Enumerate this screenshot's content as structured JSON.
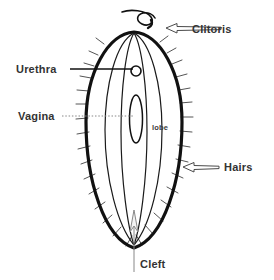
{
  "figure": {
    "background_color": "#ffffff",
    "ink_color": "#111111",
    "label_color": "#333333"
  },
  "labels": {
    "clitoris": "Clitoris",
    "urethra": "Urethra",
    "vagina": "Vagina",
    "hairs": "Hairs",
    "cleft": "Cleft",
    "lobe": "lobe"
  },
  "leaders": {
    "urethra_style": "solid-line",
    "vagina_style": "dotted-line",
    "clitoris_style": "hollow-arrow-left",
    "hairs_style": "hollow-arrow-left",
    "cleft_style": "vertical-line"
  },
  "structures": {
    "outer_oval": "vulva outline",
    "inner_lobe_lines": 4,
    "urethral_opening": "small circle",
    "vaginal_opening": "narrow vertical ellipse",
    "hair_marks": "short radiating strokes",
    "cleft_arrow": "thin arrow pointing up"
  }
}
